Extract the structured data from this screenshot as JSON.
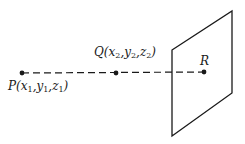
{
  "diagram": {
    "type": "point-line-plane",
    "points": [
      {
        "name": "P",
        "label_base": "P(x",
        "coords": [
          "x",
          "y",
          "z"
        ],
        "subscript": "1",
        "x": 22,
        "y": 73
      },
      {
        "name": "Q",
        "label_base": "Q(x",
        "coords": [
          "x",
          "y",
          "z"
        ],
        "subscript": "2",
        "x": 116,
        "y": 73
      },
      {
        "name": "R",
        "label": "R",
        "x": 204,
        "y": 72
      }
    ],
    "labels": {
      "P": {
        "letter": "P",
        "sub": "1"
      },
      "Q": {
        "letter": "Q",
        "sub": "2"
      },
      "R": "R"
    },
    "line": {
      "style": "dashed",
      "from": "P",
      "to": "R"
    },
    "plane": {
      "corners": [
        [
          172,
          50
        ],
        [
          232,
          11
        ],
        [
          232,
          93
        ],
        [
          172,
          136
        ]
      ]
    },
    "colors": {
      "stroke": "#1a1a1a",
      "background": "#ffffff"
    }
  }
}
